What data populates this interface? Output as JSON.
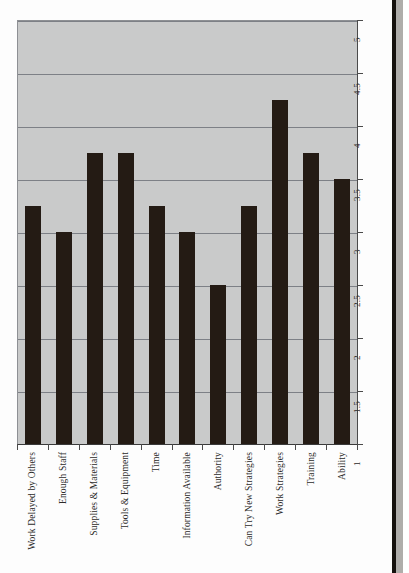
{
  "chart_data": {
    "type": "bar",
    "title": "",
    "subtitle": "",
    "xlabel": "",
    "ylabel": "",
    "categories": [
      "Work Delayed by Others",
      "Enough Staff",
      "Supplies & Materials",
      "Tools & Equipment",
      "Time",
      "Information Available",
      "Authority",
      "Can Try New Strategies",
      "Work Strategies",
      "Training",
      "Ability"
    ],
    "values": [
      3.25,
      3.0,
      3.75,
      3.75,
      3.25,
      3.0,
      2.5,
      3.25,
      4.25,
      3.75,
      3.5
    ],
    "ylim": [
      1,
      5
    ],
    "ytick_labels": [
      "1",
      "1.5",
      "2",
      "2.5",
      "3",
      "3.5",
      "4",
      "4.5",
      "5"
    ],
    "ytick_values": [
      1,
      1.5,
      2,
      2.5,
      3,
      3.5,
      4,
      4.5,
      5
    ],
    "grid": true,
    "grid_axis": "y",
    "legend": false,
    "legend_position": "none",
    "orientation": "vertical",
    "axis_position": "y-axis-right",
    "label_rotation": -90,
    "series": [
      {
        "name": "",
        "values": [
          3.25,
          3.0,
          3.75,
          3.75,
          3.25,
          3.0,
          2.5,
          3.25,
          4.25,
          3.75,
          3.5
        ]
      }
    ],
    "colors": {
      "bar": "#241b14",
      "plot_background": "#c9caca",
      "gridline": "#7d8086",
      "axis": "#4a4a4a",
      "page_background": "#fdfdfd",
      "text": "#2c2b29"
    }
  }
}
